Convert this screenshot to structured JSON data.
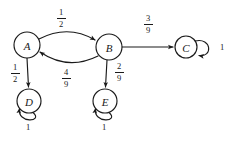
{
  "diagram": {
    "type": "state-transition-diagram",
    "background_color": "#ffffff",
    "stroke_color": "#1a1a1a",
    "nodes": [
      {
        "id": "A",
        "label": "A",
        "cx": 27,
        "cy": 45,
        "r": 13
      },
      {
        "id": "B",
        "label": "B",
        "cx": 109,
        "cy": 47,
        "r": 13
      },
      {
        "id": "C",
        "label": "C",
        "cx": 186,
        "cy": 47,
        "r": 11
      },
      {
        "id": "D",
        "label": "D",
        "cx": 29,
        "cy": 101,
        "r": 12
      },
      {
        "id": "E",
        "label": "E",
        "cx": 105,
        "cy": 101,
        "r": 12
      }
    ],
    "edges": [
      {
        "id": "a-to-b",
        "from": "A",
        "to": "B",
        "kind": "curve-top",
        "label_numerator": "1",
        "label_denominator": "2",
        "label_x": 61,
        "label_y": 8
      },
      {
        "id": "b-to-a",
        "from": "B",
        "to": "A",
        "kind": "curve-bottom",
        "label_numerator": "4",
        "label_denominator": "9",
        "label_x": 60,
        "label_y": 68
      },
      {
        "id": "b-to-c",
        "from": "B",
        "to": "C",
        "kind": "straight",
        "label_numerator": "3",
        "label_denominator": "9",
        "label_x": 143,
        "label_y": 14
      },
      {
        "id": "a-to-d",
        "from": "A",
        "to": "D",
        "kind": "straight",
        "label_numerator": "1",
        "label_denominator": "2",
        "label_x": 8,
        "label_y": 63
      },
      {
        "id": "b-to-e",
        "from": "B",
        "to": "E",
        "kind": "straight",
        "label_numerator": "2",
        "label_denominator": "9",
        "label_x": 112,
        "label_y": 62
      },
      {
        "id": "c-self",
        "from": "C",
        "to": "C",
        "kind": "self-loop-right",
        "label": "1",
        "label_x": 219,
        "label_y": 43
      },
      {
        "id": "d-self",
        "from": "D",
        "to": "D",
        "kind": "self-loop-bottom",
        "label": "1",
        "label_x": 23,
        "label_y": 124
      },
      {
        "id": "e-self",
        "from": "E",
        "to": "E",
        "kind": "self-loop-bottom",
        "label": "1",
        "label_x": 99,
        "label_y": 124
      }
    ]
  }
}
